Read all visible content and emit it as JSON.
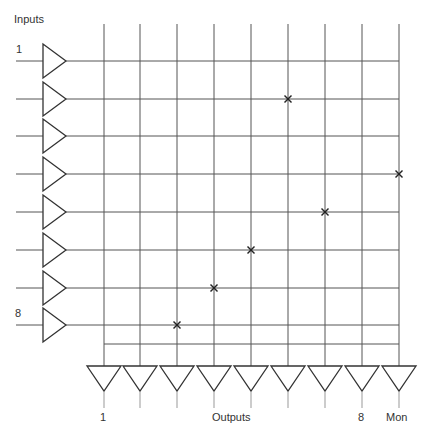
{
  "diagram": {
    "title_inputs": "Inputs",
    "title_outputs": "Outputs",
    "input_first_label": "1",
    "input_last_label": "8",
    "output_first_label": "1",
    "output_last_label": "8",
    "monitor_label": "Mon",
    "inputs_count": 8,
    "outputs": [
      "1",
      "2",
      "3",
      "4",
      "5",
      "6",
      "7",
      "8",
      "Mon"
    ],
    "crosspoints": [
      {
        "input": 2,
        "output": 6
      },
      {
        "input": 4,
        "output": "Mon"
      },
      {
        "input": 5,
        "output": 7
      },
      {
        "input": 6,
        "output": 5
      },
      {
        "input": 7,
        "output": 4
      },
      {
        "input": 8,
        "output": 3
      }
    ],
    "colors": {
      "line": "#555555",
      "symbol": "#333333",
      "cross": "#222222"
    }
  }
}
